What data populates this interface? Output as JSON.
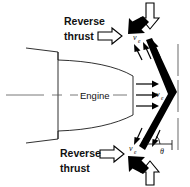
{
  "figure": {
    "background_color": "#ffffff",
    "line_color": "#1a1a1a",
    "fill_color": "#000000"
  },
  "labels": {
    "engine": "Engine",
    "reverse_thrust_top_line1": "Reverse",
    "reverse_thrust_top_line2": "thrust",
    "reverse_thrust_bottom_line1": "Reverse",
    "reverse_thrust_bottom_line2": "thrust",
    "theta": "θ",
    "velocity_symbol": "v",
    "velocity_subscript": "e"
  },
  "velocity_labels": [
    {
      "id": "ve-upper",
      "symbol": "v",
      "subscript": "e"
    },
    {
      "id": "ve-middle",
      "symbol": "v",
      "subscript": "e"
    },
    {
      "id": "ve-lower",
      "symbol": "v",
      "subscript": "e"
    }
  ],
  "icons": {
    "hollow_arrow_down": "hollow-arrow-down-icon",
    "hollow_arrow_up": "hollow-arrow-up-icon",
    "hollow_arrow_right_top": "hollow-arrow-right-icon",
    "hollow_arrow_right_bottom": "hollow-arrow-right-icon",
    "solid_arrow_down_left_top": "solid-arrow-down-left-icon",
    "solid_arrow_up_left_bottom": "solid-arrow-up-left-icon",
    "exhaust_arrows_upper": "exhaust-flow-arrows-icon",
    "exhaust_arrows_middle": "exhaust-flow-arrows-icon",
    "exhaust_arrows_lower": "exhaust-flow-arrows-icon",
    "deflector": "chevron-deflector-icon",
    "angle_arc": "angle-arc-icon"
  }
}
